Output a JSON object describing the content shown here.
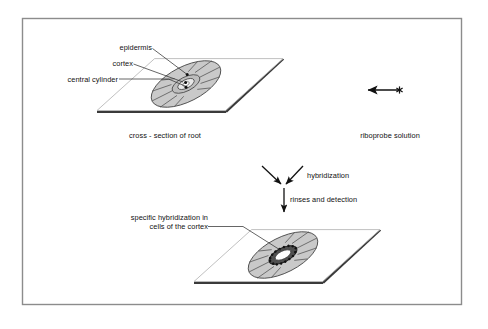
{
  "figure": {
    "frame_color": "#8c8c8c",
    "background_color": "#ffffff"
  },
  "colors": {
    "slide_face": "#ffffff",
    "slide_edge_dark": "#3a3a3a",
    "slide_edge_light": "#b9b9b9",
    "section_fill": "#c9c9c9",
    "section_stroke": "#4a4a4a",
    "cylinder_fill": "#d8d8d8",
    "signal_dots": "#1a1a1a",
    "text": "#111111",
    "leader_line": "#333333",
    "arrow": "#111111"
  },
  "top_panel": {
    "labels": [
      {
        "id": "epidermis",
        "text": "epidermis"
      },
      {
        "id": "cortex",
        "text": "cortex"
      },
      {
        "id": "central-cylinder",
        "text": "central cylinder"
      }
    ],
    "caption": "cross - section of root"
  },
  "probe_panel": {
    "caption": "riboprobe solution",
    "symbol": {
      "name": "riboprobe-arrow-star",
      "arrowhead_side": "left",
      "marker_side": "right",
      "marker": "asterisk"
    }
  },
  "steps": [
    {
      "id": "hybridization",
      "label": "hybridization",
      "arrow": "two-converging-diagonal-arrows"
    },
    {
      "id": "rinses-and-detection",
      "label": "rinses and detection",
      "arrow": "down-arrow"
    }
  ],
  "bottom_panel": {
    "label_line1": "specific hybridization in",
    "label_line2": "cells of the cortex"
  }
}
